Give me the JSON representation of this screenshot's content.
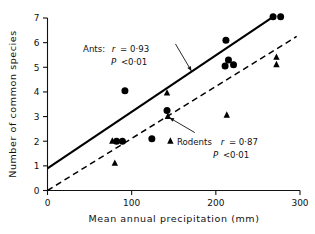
{
  "chart_data": {
    "type": "scatter",
    "title": "",
    "xlabel": "Mean annual precipitation (mm)",
    "ylabel": "Number of common species",
    "xlim": [
      0,
      300
    ],
    "ylim": [
      0,
      7
    ],
    "xticks": [
      0,
      100,
      200,
      300
    ],
    "yticks": [
      0,
      1,
      2,
      3,
      4,
      5,
      6,
      7
    ],
    "xtick_labels": [
      "0",
      "100",
      "200",
      "300"
    ],
    "ytick_labels": [
      "0",
      "1",
      "2",
      "3",
      "4",
      "5",
      "6",
      "7"
    ],
    "grid": false,
    "legend": "none",
    "series": [
      {
        "name": "Ants",
        "marker": "filled-circle",
        "color": "#000000",
        "points": [
          {
            "x": 82,
            "y": 2.0
          },
          {
            "x": 89,
            "y": 2.0
          },
          {
            "x": 92,
            "y": 4.05
          },
          {
            "x": 124,
            "y": 2.1
          },
          {
            "x": 142,
            "y": 3.25
          },
          {
            "x": 211,
            "y": 5.05
          },
          {
            "x": 212,
            "y": 6.1
          },
          {
            "x": 215,
            "y": 5.3
          },
          {
            "x": 221,
            "y": 5.1
          },
          {
            "x": 268,
            "y": 7.05
          },
          {
            "x": 277,
            "y": 7.05
          }
        ],
        "fit_line": {
          "style": "solid",
          "x0": 0,
          "y0": 0.9,
          "x1": 268,
          "y1": 7.05
        },
        "stats": {
          "r": "0·93",
          "p": "<0·01"
        }
      },
      {
        "name": "Rodents",
        "marker": "filled-triangle",
        "color": "#000000",
        "points": [
          {
            "x": 77,
            "y": 2.0
          },
          {
            "x": 80,
            "y": 1.1
          },
          {
            "x": 142,
            "y": 3.95
          },
          {
            "x": 143,
            "y": 3.0
          },
          {
            "x": 146,
            "y": 2.0
          },
          {
            "x": 213,
            "y": 3.05
          },
          {
            "x": 272,
            "y": 5.4
          },
          {
            "x": 272,
            "y": 5.1
          }
        ],
        "fit_line": {
          "style": "dashed",
          "x0": 0,
          "y0": 0.0,
          "x1": 296,
          "y1": 6.25
        },
        "stats": {
          "r": "0·87",
          "p": "<0·01"
        }
      }
    ],
    "annotations": [
      {
        "id": "ants-annotation",
        "line1_label": "Ants:",
        "line1_stat_var": "r",
        "line1_stat_eq": "= 0·93",
        "line2_stat_var": "P",
        "line2_stat_eq": "<0·01",
        "leader": {
          "from_x": 152,
          "from_y": 5.95,
          "to_x": 171,
          "to_y": 4.85
        }
      },
      {
        "id": "rodents-annotation",
        "line1_label": "Rodents",
        "line1_stat_var": "r",
        "line1_stat_eq": "= 0·87",
        "line2_stat_var": "P",
        "line2_stat_eq": "<0·01",
        "leader": {
          "from_x": 175,
          "from_y": 2.35,
          "to_x": 145,
          "to_y": 2.95
        }
      }
    ]
  },
  "axes": {
    "x_label": "Mean annual precipitation (mm)",
    "y_label": "Number of common species",
    "x_ticks": [
      "0",
      "100",
      "200",
      "300"
    ],
    "y_ticks": [
      "7",
      "6",
      "5",
      "4",
      "3",
      "2",
      "1",
      "0"
    ]
  },
  "annotations": {
    "ants": {
      "label": "Ants:",
      "r_var": "r",
      "r_val": "= 0·93",
      "p_var": "P",
      "p_val": "<0·01"
    },
    "rodents": {
      "label": "Rodents",
      "r_var": "r",
      "r_val": "= 0·87",
      "p_var": "P",
      "p_val": "<0·01"
    }
  },
  "colors": {
    "ink": "#111111",
    "marker": "#000000",
    "background": "#ffffff"
  }
}
